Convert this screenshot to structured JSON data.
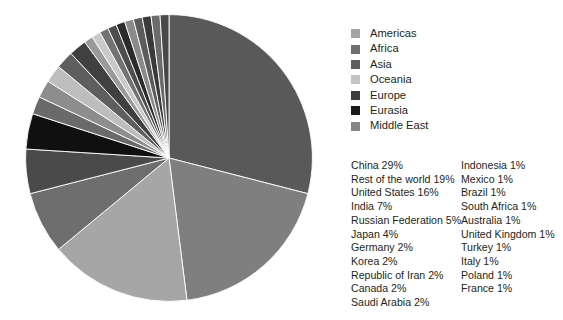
{
  "chart_data": {
    "type": "pie",
    "title": "",
    "legend_position": "right",
    "start_angle_deg": 0,
    "direction": "clockwise",
    "categories": [
      "China",
      "Rest of the world",
      "United States",
      "India",
      "Russian Federation",
      "Japan",
      "Germany",
      "Korea",
      "Republic of Iran",
      "Canada",
      "Saudi Arabia",
      "Indonesia",
      "Mexico",
      "Brazil",
      "South Africa",
      "Australia",
      "United Kingdom",
      "Turkey",
      "Italy",
      "Poland",
      "France"
    ],
    "values": [
      29,
      19,
      16,
      7,
      5,
      4,
      2,
      2,
      2,
      2,
      2,
      1,
      1,
      1,
      1,
      1,
      1,
      1,
      1,
      1,
      1
    ],
    "units": "%",
    "slice_colors": [
      "#595959",
      "#7f7f7f",
      "#a6a6a6",
      "#6e6e6e",
      "#4a4a4a",
      "#101010",
      "#6a6a6a",
      "#8d8d8d",
      "#bdbdbd",
      "#5e5e5e",
      "#404040",
      "#9a9a9a",
      "#c9c9c9",
      "#737373",
      "#4d4d4d",
      "#2b2b2b",
      "#8a8a8a",
      "#5c5c5c",
      "#3a3a3a",
      "#6b6b6b",
      "#484848"
    ],
    "groups": [
      "Americas",
      "Africa",
      "Asia",
      "Oceania",
      "Europe",
      "Eurasia",
      "Middle East"
    ]
  },
  "legend": {
    "items": [
      {
        "label": "Americas",
        "color": "#a3a3a3"
      },
      {
        "label": "Africa",
        "color": "#6f6f6f"
      },
      {
        "label": "Asia",
        "color": "#5e5e5e"
      },
      {
        "label": "Oceania",
        "color": "#c4c4c4"
      },
      {
        "label": "Europe",
        "color": "#3f3f3f"
      },
      {
        "label": "Eurasia",
        "color": "#1a1a1a"
      },
      {
        "label": "Middle East",
        "color": "#858585"
      }
    ]
  },
  "data_labels": {
    "left_column": [
      "China 29%",
      "Rest of the world 19%",
      "United States 16%",
      "India 7%",
      "Russian Federation 5%",
      "Japan 4%",
      "Germany 2%",
      "Korea 2%",
      "Republic of Iran 2%",
      "Canada 2%",
      "Saudi Arabia 2%"
    ],
    "right_column": [
      "Indonesia 1%",
      "Mexico 1%",
      "Brazil 1%",
      "South Africa 1%",
      "Australia 1%",
      "United Kingdom 1%",
      "Turkey 1%",
      "Italy 1%",
      "Poland 1%",
      "France 1%"
    ]
  }
}
